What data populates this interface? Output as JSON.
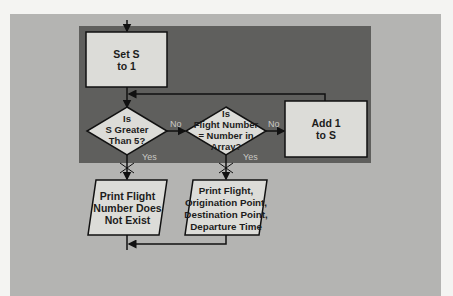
{
  "flowchart": {
    "nodes": {
      "set_s": {
        "type": "process",
        "text": "Set S\nto 1"
      },
      "check_s": {
        "type": "decision",
        "text": "Is\nS Greater\nThan 5?"
      },
      "check_flight": {
        "type": "decision",
        "text": "Is\nFlight Number\n= Number in\nArray?"
      },
      "add_one": {
        "type": "process",
        "text": "Add 1\nto S"
      },
      "print_not_exist": {
        "type": "output",
        "text": "Print Flight\nNumber Does\nNot Exist"
      },
      "print_details": {
        "type": "output",
        "text": "Print Flight,\nOrigination Point,\nDestination Point,\nDeparture Time"
      }
    },
    "edges": {
      "check_s_no": "No",
      "check_s_yes": "Yes",
      "check_flight_no": "No",
      "check_flight_yes": "Yes"
    },
    "colors": {
      "background": "#b4b4b2",
      "panel": "#5f5f5d",
      "shape_fill": "#dcdcd8",
      "line": "#111111"
    }
  }
}
